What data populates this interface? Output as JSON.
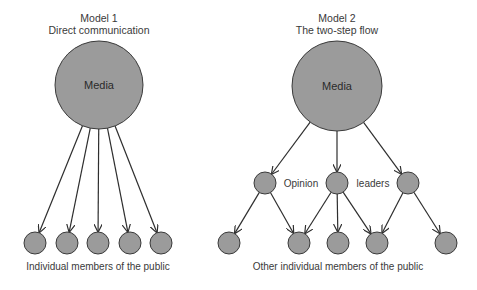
{
  "model1": {
    "title": "Model 1",
    "subtitle": "Direct communication",
    "source_label": "Media",
    "caption": "Individual members of the public",
    "source": {
      "cx": 99,
      "cy": 85,
      "r": 44
    },
    "targets": [
      {
        "cx": 35,
        "cy": 243
      },
      {
        "cx": 67,
        "cy": 243
      },
      {
        "cx": 98,
        "cy": 243
      },
      {
        "cx": 130,
        "cy": 243
      },
      {
        "cx": 161,
        "cy": 243
      }
    ],
    "target_radius": 11
  },
  "model2": {
    "title": "Model 2",
    "subtitle": "The two-step flow",
    "source_label": "Media",
    "leader_label_1": "Opinion",
    "leader_label_2": "leaders",
    "caption": "Other individual members of the public",
    "source": {
      "cx": 337,
      "cy": 86,
      "r": 45
    },
    "leaders": [
      {
        "cx": 265,
        "cy": 183
      },
      {
        "cx": 337,
        "cy": 183
      },
      {
        "cx": 408,
        "cy": 183
      }
    ],
    "public": [
      {
        "cx": 229,
        "cy": 243
      },
      {
        "cx": 299,
        "cy": 243
      },
      {
        "cx": 338,
        "cy": 243
      },
      {
        "cx": 377,
        "cy": 243
      },
      {
        "cx": 446,
        "cy": 243
      }
    ],
    "node_radius": 11,
    "leader_edges": [
      [
        0,
        0
      ],
      [
        0,
        1
      ],
      [
        1,
        1
      ],
      [
        1,
        2
      ],
      [
        1,
        3
      ],
      [
        2,
        3
      ],
      [
        2,
        4
      ]
    ]
  },
  "colors": {
    "node_fill": "#9b9b9b",
    "node_stroke": "#3a3a3a",
    "edge": "#2e2e2e",
    "text": "#3a3a3a"
  }
}
